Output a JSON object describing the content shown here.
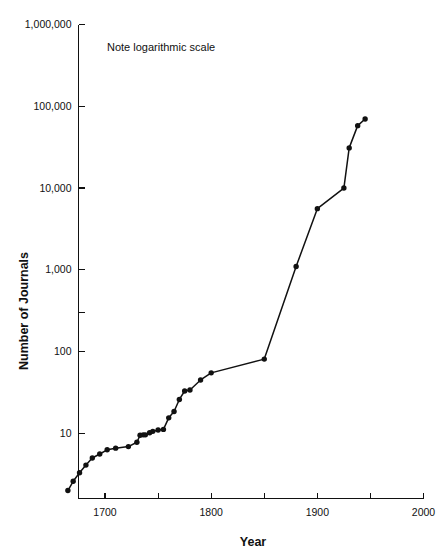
{
  "figure": {
    "note": "Note logarithmic scale",
    "caption": ""
  },
  "chart_data": {
    "type": "line",
    "title": "",
    "subtitle": "",
    "annotations": [
      "Note logarithmic scale"
    ],
    "xlabel": "Year",
    "ylabel": "Number of Journals",
    "yscale": "log",
    "xscale": "linear",
    "xlim": [
      1675,
      2000
    ],
    "ylim": [
      1.6,
      1000000
    ],
    "grid": false,
    "legend": null,
    "xticks": [
      1675,
      1700,
      1750,
      1800,
      1850,
      1900,
      1950,
      2000
    ],
    "xticklabels": [
      "",
      "1700",
      "",
      "1800",
      "",
      "1900",
      "",
      "2000"
    ],
    "xtick_major_labels": [
      "1700",
      "1800",
      "1900",
      "2000"
    ],
    "yticks": [
      10,
      100,
      1000,
      10000,
      100000,
      1000000
    ],
    "yticklabels": [
      "10",
      "100",
      "1,000",
      "10,000",
      "100,000",
      "1,000,000"
    ],
    "marker": "filled-circle",
    "series": [
      {
        "name": "Number of Journals",
        "x": [
          1665,
          1670,
          1676,
          1682,
          1688,
          1695,
          1702,
          1710,
          1722,
          1730,
          1733,
          1736,
          1738,
          1742,
          1745,
          1750,
          1755,
          1760,
          1765,
          1770,
          1775,
          1780,
          1790,
          1800,
          1850,
          1880,
          1900,
          1925,
          1930,
          1938,
          1945
        ],
        "y": [
          2,
          2.6,
          3.3,
          4.1,
          5.0,
          5.6,
          6.3,
          6.6,
          6.9,
          7.8,
          9.5,
          9.6,
          9.6,
          10.2,
          10.6,
          11.0,
          11.2,
          15.5,
          18.5,
          26.0,
          33.0,
          34.0,
          45.0,
          55.0,
          81.0,
          1100.0,
          5600.0,
          10000.0,
          31000.0,
          58000.0,
          70000.0
        ]
      }
    ]
  }
}
